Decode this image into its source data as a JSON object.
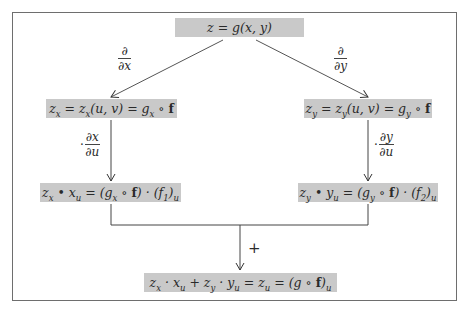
{
  "diagram": {
    "top": {
      "text": "z = g(x, y)"
    },
    "partial_x_label": {
      "num": "∂",
      "den": "∂x"
    },
    "partial_y_label": {
      "num": "∂",
      "den": "∂y"
    },
    "left_mid": {
      "text": "z_x = z_x(u, v) = g_x ∘ f"
    },
    "right_mid": {
      "text": "z_y = z_y(u, v) = g_y ∘ f"
    },
    "left_mult_label": {
      "prefix": "·",
      "num": "∂x",
      "den": "∂u"
    },
    "right_mult_label": {
      "prefix": "·",
      "num": "∂y",
      "den": "∂u"
    },
    "left_bottom": {
      "text": "z_x • x_u = (g_x ∘ f) · (f_1)_u"
    },
    "right_bottom": {
      "text": "z_y • y_u = (g_y ∘ f) · (f_2)_u"
    },
    "sum_label": "+",
    "result": {
      "text": "z_x · x_u + z_y · y_u = z_u = (g ∘ f)_u"
    }
  },
  "colors": {
    "box_fill": "#c9c9c9",
    "frame": "#6e6e6e",
    "arrow": "#333333"
  }
}
